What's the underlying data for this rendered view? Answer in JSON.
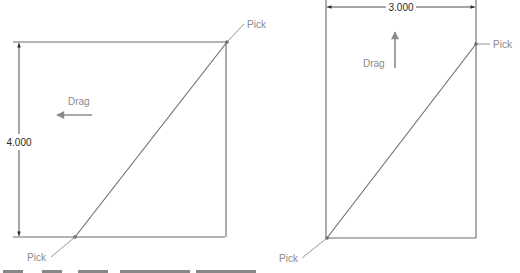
{
  "figures": [
    {
      "id": "left",
      "dimension_value": "4.000",
      "dimension_orientation": "vertical",
      "drag_label": "Drag",
      "drag_direction": "left",
      "pick_labels": [
        "Pick",
        "Pick"
      ]
    },
    {
      "id": "right",
      "dimension_value": "3.000",
      "dimension_orientation": "horizontal",
      "drag_label": "Drag",
      "drag_direction": "up",
      "pick_labels": [
        "Pick",
        "Pick"
      ]
    }
  ],
  "colors": {
    "geometry": "#6a6a6a",
    "dimension": "#3a3a3a",
    "annotation": "#8a8a8a"
  }
}
